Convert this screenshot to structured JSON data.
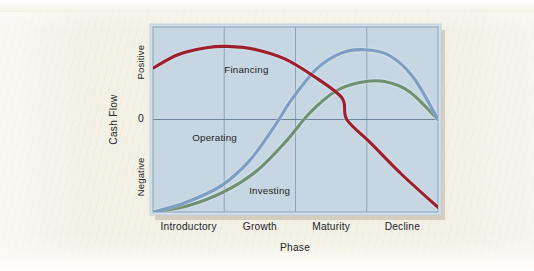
{
  "figure": {
    "paper_color": "#f3f0e5",
    "plot_background_color": "#c3d4e2",
    "plot_border_color": "#8fa8bd",
    "gridline_color": "#7e95a8",
    "shadow_color": "#b9b2a0"
  },
  "chart_data": {
    "type": "line",
    "title": "",
    "subtitle": "",
    "xlabel": "Phase",
    "ylabel": "Cash Flow",
    "x": [
      "Introductory",
      "Growth",
      "Maturity",
      "Decline"
    ],
    "categories": [
      "Introductory",
      "Growth",
      "Maturity",
      "Decline"
    ],
    "xtick_labels": [
      "Introductory",
      "Growth",
      "Maturity",
      "Decline"
    ],
    "ytick_labels": [
      "Positive",
      "0",
      "Negative"
    ],
    "ylim": [
      -1.0,
      1.0
    ],
    "xlim": [
      0,
      4
    ],
    "grid": true,
    "legend_position": "inline-labels",
    "annotations": [
      "Financing",
      "Operating",
      "Investing"
    ],
    "series": [
      {
        "name": "Financing",
        "color": "#9e1f2c",
        "label_x": 1.0,
        "label_y": 0.5,
        "points": [
          {
            "x": 0.0,
            "y": 0.555
          },
          {
            "x": 0.35,
            "y": 0.7
          },
          {
            "x": 0.75,
            "y": 0.775
          },
          {
            "x": 1.05,
            "y": 0.79
          },
          {
            "x": 1.45,
            "y": 0.755
          },
          {
            "x": 1.85,
            "y": 0.655
          },
          {
            "x": 2.25,
            "y": 0.47
          },
          {
            "x": 2.65,
            "y": 0.235
          },
          {
            "x": 2.72,
            "y": 0.0
          },
          {
            "x": 3.05,
            "y": -0.25
          },
          {
            "x": 3.5,
            "y": -0.6
          },
          {
            "x": 4.0,
            "y": -0.95
          }
        ]
      },
      {
        "name": "Operating",
        "color": "#7d9dc4",
        "label_x": 0.55,
        "label_y": -0.23,
        "points": [
          {
            "x": 0.0,
            "y": -1.0
          },
          {
            "x": 0.45,
            "y": -0.9
          },
          {
            "x": 0.95,
            "y": -0.72
          },
          {
            "x": 1.35,
            "y": -0.45
          },
          {
            "x": 1.7,
            "y": -0.08
          },
          {
            "x": 1.95,
            "y": 0.22
          },
          {
            "x": 2.3,
            "y": 0.55
          },
          {
            "x": 2.65,
            "y": 0.72
          },
          {
            "x": 2.95,
            "y": 0.755
          },
          {
            "x": 3.3,
            "y": 0.7
          },
          {
            "x": 3.65,
            "y": 0.46
          },
          {
            "x": 4.0,
            "y": 0.0
          }
        ]
      },
      {
        "name": "Investing",
        "color": "#6f9070",
        "label_x": 1.35,
        "label_y": -0.8,
        "points": [
          {
            "x": 0.0,
            "y": -1.0
          },
          {
            "x": 0.5,
            "y": -0.93
          },
          {
            "x": 1.0,
            "y": -0.78
          },
          {
            "x": 1.45,
            "y": -0.56
          },
          {
            "x": 1.85,
            "y": -0.25
          },
          {
            "x": 2.2,
            "y": 0.07
          },
          {
            "x": 2.55,
            "y": 0.3
          },
          {
            "x": 2.9,
            "y": 0.4
          },
          {
            "x": 3.25,
            "y": 0.41
          },
          {
            "x": 3.6,
            "y": 0.3
          },
          {
            "x": 4.0,
            "y": 0.0
          }
        ]
      }
    ]
  }
}
